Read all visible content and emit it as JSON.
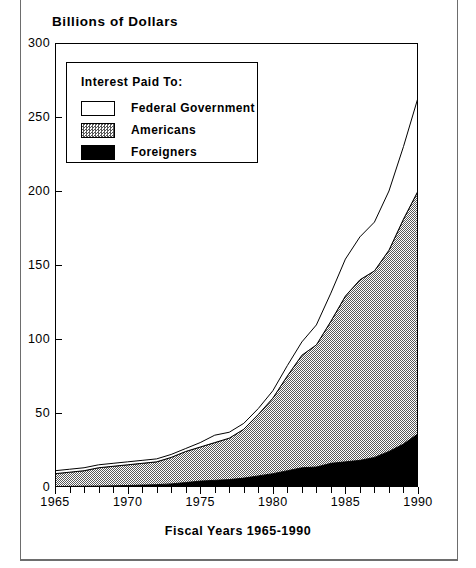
{
  "axis": {
    "y_title": "Billions of Dollars",
    "x_title": "Fiscal Years 1965-1990",
    "y_ticks": [
      "0",
      "50",
      "100",
      "150",
      "200",
      "250",
      "300"
    ],
    "x_ticks": [
      "1965",
      "1970",
      "1975",
      "1980",
      "1985",
      "1990"
    ]
  },
  "legend": {
    "title": "Interest Paid To:",
    "items": [
      {
        "label": "Federal Government",
        "fill": "white"
      },
      {
        "label": "Americans",
        "fill": "hatch"
      },
      {
        "label": "Foreigners",
        "fill": "black"
      }
    ]
  },
  "chart_data": {
    "type": "area",
    "title": "Billions of Dollars",
    "subtitle": "",
    "xlabel": "Fiscal Years 1965-1990",
    "ylabel": "Billions of Dollars",
    "xlim": [
      1965,
      1990
    ],
    "ylim": [
      0,
      300
    ],
    "grid": false,
    "stacked": true,
    "legend_title": "Interest Paid To:",
    "legend_position": "upper-left-inside",
    "x": [
      1965,
      1966,
      1967,
      1968,
      1969,
      1970,
      1971,
      1972,
      1973,
      1974,
      1975,
      1976,
      1977,
      1978,
      1979,
      1980,
      1981,
      1982,
      1983,
      1984,
      1985,
      1986,
      1987,
      1988,
      1989,
      1990
    ],
    "series": [
      {
        "name": "Foreigners",
        "color": "#000000",
        "values": [
          0.3,
          0.4,
          0.5,
          0.6,
          0.8,
          1.0,
          1.3,
          1.6,
          2.1,
          3.0,
          4.0,
          4.5,
          5.0,
          6.0,
          7.5,
          9.0,
          11.0,
          13.0,
          13.5,
          16.0,
          17.0,
          18.0,
          20.0,
          24.0,
          29.0,
          36.0
        ]
      },
      {
        "name": "Americans",
        "color": "#9a9a9a",
        "values": [
          8.7,
          9.6,
          10.5,
          12.4,
          13.2,
          14.0,
          14.7,
          15.4,
          17.9,
          21.0,
          23.0,
          25.5,
          28.0,
          33.0,
          41.5,
          51.0,
          64.0,
          76.0,
          82.5,
          96.0,
          112.0,
          122.0,
          126.0,
          136.0,
          152.0,
          164.0
        ]
      },
      {
        "name": "Federal Government",
        "color": "#ffffff",
        "values": [
          2.0,
          2.0,
          2.0,
          2.0,
          2.0,
          2.0,
          2.0,
          2.0,
          2.0,
          2.0,
          3.0,
          5.0,
          4.0,
          4.0,
          4.0,
          5.0,
          7.0,
          9.0,
          13.5,
          19.0,
          25.0,
          29.0,
          33.0,
          40.0,
          49.0,
          63.0
        ]
      }
    ],
    "totals": [
      11,
      12,
      13,
      15,
      16,
      17,
      18,
      19,
      22,
      26,
      30,
      35,
      37,
      43,
      53,
      65,
      82,
      98,
      109,
      131,
      154,
      169,
      179,
      200,
      230,
      263
    ]
  }
}
